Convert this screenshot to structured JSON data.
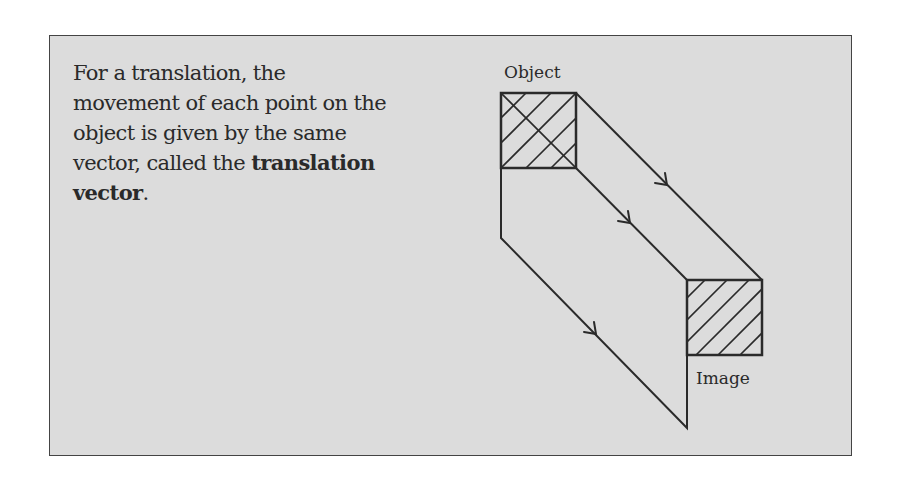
{
  "caption": {
    "line1": "For a translation, the",
    "line2": "movement of each point on the",
    "line3": "object is given by the same",
    "line4_prefix": "vector, called the ",
    "bold_term_part1": "translation",
    "bold_term_part2": "vector",
    "suffix": "."
  },
  "diagram": {
    "object_label": "Object",
    "image_label": "Image",
    "line_color": "#2a2a2a",
    "background_color": "#dcdcdc"
  }
}
